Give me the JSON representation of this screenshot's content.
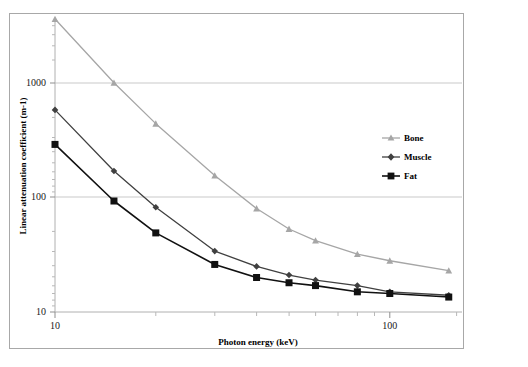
{
  "chart_data": {
    "type": "line",
    "title": "",
    "xlabel": "Photon energy (keV)",
    "ylabel": "Linear attenuation coefficient (m-1)",
    "xscale": "log",
    "yscale": "log",
    "xlim": [
      10,
      150
    ],
    "ylim": [
      10,
      5000
    ],
    "xticks": [
      10,
      100
    ],
    "xtick_labels": [
      "10",
      "100"
    ],
    "yticks": [
      10,
      100,
      1000
    ],
    "ytick_labels": [
      "10",
      "100",
      "1000"
    ],
    "grid": true,
    "legend_position": "right-inside",
    "x": [
      10,
      15,
      20,
      30,
      40,
      50,
      60,
      80,
      100,
      150
    ],
    "series": [
      {
        "name": "Bone",
        "marker": "triangle",
        "color": "#a6a6a6",
        "values": [
          3600,
          1000,
          440,
          155,
          80,
          53,
          42,
          32,
          28,
          23
        ]
      },
      {
        "name": "Muscle",
        "marker": "diamond",
        "color": "#404040",
        "values": [
          580,
          170,
          82,
          34,
          25,
          21,
          19,
          17,
          15,
          14
        ]
      },
      {
        "name": "Fat",
        "marker": "square",
        "color": "#111111",
        "values": [
          290,
          93,
          49,
          26,
          20,
          18,
          17,
          15,
          14.5,
          13.5
        ]
      }
    ]
  },
  "axes": {
    "x_label": "Photon energy (keV)",
    "y_label": "Linear attenuation coefficient (m-1)",
    "x_tick_10": "10",
    "x_tick_100": "100",
    "y_tick_10": "10",
    "y_tick_100": "100",
    "y_tick_1000": "1000"
  },
  "legend": {
    "items": [
      {
        "label": "Bone"
      },
      {
        "label": "Muscle"
      },
      {
        "label": "Fat"
      }
    ]
  },
  "colors": {
    "bone": "#a6a6a6",
    "muscle": "#404040",
    "fat": "#111111",
    "grid": "#c9c9c9",
    "axis": "#b0b0b0",
    "frame": "#a8a8a8"
  }
}
